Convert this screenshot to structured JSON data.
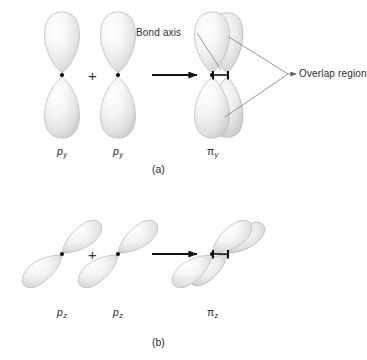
{
  "figure": {
    "background_color": "#fefefe",
    "ink_color": "#2a2a2a",
    "orbital_fill_light": "#fdfdfd",
    "orbital_fill_shade": "#d8d8d8",
    "orbital_outline": "#b9b9b9"
  },
  "panels": [
    {
      "id": "panel-a",
      "caption": "(a)",
      "operator": "+",
      "operands": [
        {
          "name": "p-orbital-1",
          "label_base": "p",
          "label_sub": "y",
          "orientation": "vertical"
        },
        {
          "name": "p-orbital-2",
          "label_base": "p",
          "label_sub": "y",
          "orientation": "vertical"
        }
      ],
      "product": {
        "name": "pi-orbital",
        "label_base": "π",
        "label_sub": "y",
        "orientation": "vertical"
      },
      "annotations": [
        {
          "name": "bond-axis-callout",
          "text": "Bond axis"
        },
        {
          "name": "overlap-region-callout",
          "text": "Overlap region"
        }
      ]
    },
    {
      "id": "panel-b",
      "caption": "(b)",
      "operator": "+",
      "operands": [
        {
          "name": "p-orbital-1",
          "label_base": "p",
          "label_sub": "z",
          "orientation": "diagonal"
        },
        {
          "name": "p-orbital-2",
          "label_base": "p",
          "label_sub": "z",
          "orientation": "diagonal"
        }
      ],
      "product": {
        "name": "pi-orbital",
        "label_base": "π",
        "label_sub": "z",
        "orientation": "diagonal"
      },
      "annotations": []
    }
  ],
  "labels": {
    "a_py_1": "p",
    "a_py_1_sub": "y",
    "a_py_2": "p",
    "a_py_2_sub": "y",
    "a_pi": "π",
    "a_pi_sub": "y",
    "a_caption": "(a)",
    "a_plus": "+",
    "bond_axis": "Bond axis",
    "overlap_region": "Overlap region",
    "b_pz_1": "p",
    "b_pz_1_sub": "z",
    "b_pz_2": "p",
    "b_pz_2_sub": "z",
    "b_pi": "π",
    "b_pi_sub": "z",
    "b_caption": "(b)",
    "b_plus": "+"
  }
}
